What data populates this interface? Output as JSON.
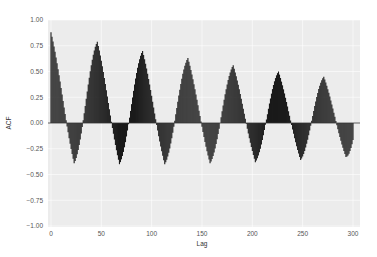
{
  "chart_data": {
    "type": "bar",
    "subtype": "acf-stem",
    "title": "",
    "xlabel": "Lag",
    "ylabel": "ACF",
    "xlim": [
      -1,
      305
    ],
    "ylim": [
      -1.0,
      1.0
    ],
    "xticks": [
      0,
      50,
      100,
      150,
      200,
      250,
      300
    ],
    "yticks": [
      1.0,
      0.75,
      0.5,
      0.25,
      0.0,
      -0.25,
      -0.5,
      -0.75,
      -1.0
    ],
    "ytick_labels": [
      "1.00",
      "0.75",
      "0.50",
      "0.25",
      "0.00",
      "−0.25",
      "−0.50",
      "−0.75",
      "−1.00"
    ],
    "xtick_labels": [
      "0",
      "50",
      "100",
      "150",
      "200",
      "250",
      "300"
    ],
    "grid": true,
    "legend": null,
    "period_approx": 45,
    "peaks": [
      {
        "lag": 0,
        "value": 0.88
      },
      {
        "lag": 46,
        "value": 0.79
      },
      {
        "lag": 91,
        "value": 0.7
      },
      {
        "lag": 136,
        "value": 0.63
      },
      {
        "lag": 181,
        "value": 0.56
      },
      {
        "lag": 226,
        "value": 0.5
      },
      {
        "lag": 271,
        "value": 0.45
      }
    ],
    "troughs": [
      {
        "lag": 23,
        "value": -0.39
      },
      {
        "lag": 68,
        "value": -0.4
      },
      {
        "lag": 113,
        "value": -0.4
      },
      {
        "lag": 158,
        "value": -0.39
      },
      {
        "lag": 203,
        "value": -0.38
      },
      {
        "lag": 248,
        "value": -0.36
      },
      {
        "lag": 293,
        "value": -0.33
      }
    ],
    "n_lags": 301,
    "colors": {
      "bar": "#1a1a1a",
      "plot_background": "#ececec",
      "grid": "#ffffff",
      "zero_line": "#333333"
    }
  }
}
